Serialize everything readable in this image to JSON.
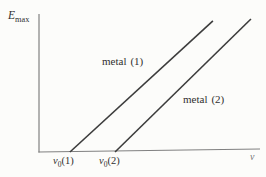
{
  "colors": {
    "background": "#fcfcfa",
    "axis": "#808080",
    "line": "#3c3c3c",
    "text": "#2f2f2f",
    "faint_text": "#777777"
  },
  "labels": {
    "y_axis": {
      "symbol": "E",
      "subscript": "max"
    },
    "x_axis": {
      "symbol": "ν"
    },
    "line1_annotation": {
      "word": "metal",
      "paren": "(1)"
    },
    "line2_annotation": {
      "word": "metal",
      "paren": "(2)"
    },
    "tick1": {
      "symbol": "ν",
      "subscript": "0",
      "paren": "(1)"
    },
    "tick2": {
      "symbol": "ν",
      "subscript": "0",
      "paren": "(2)"
    }
  },
  "chart_data": {
    "type": "line",
    "title": "",
    "xlabel": "ν",
    "ylabel": "E_max",
    "x_tick_labels": [
      "ν₀(1)",
      "ν₀(2)"
    ],
    "y_tick_labels": [],
    "grid": false,
    "legend_position": "inline annotations on lines",
    "series": [
      {
        "name": "metal (1)",
        "annotation": "metal (1)",
        "x_intercept_label": "ν₀(1)",
        "points_frac": [
          [
            0.14,
            0.0
          ],
          [
            0.787,
            0.936
          ]
        ]
      },
      {
        "name": "metal (2)",
        "annotation": "metal (2)",
        "x_intercept_label": "ν₀(2)",
        "points_frac": [
          [
            0.344,
            0.0
          ],
          [
            0.959,
            0.95
          ]
        ]
      }
    ]
  }
}
